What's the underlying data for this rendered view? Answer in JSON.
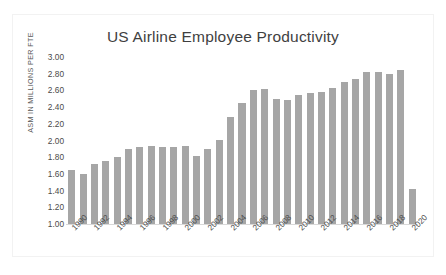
{
  "chart_data": {
    "type": "bar",
    "title": "US Airline Employee Productivity",
    "xlabel": "",
    "ylabel": "ASM IN MILLIONS PER FTE",
    "ylim": [
      1.0,
      3.0
    ],
    "ytick_step": 0.2,
    "ytick_labels": [
      "3.00",
      "2.80",
      "2.60",
      "2.40",
      "2.20",
      "2.00",
      "1.80",
      "1.60",
      "1.40",
      "1.20",
      "1.00"
    ],
    "ytick_values": [
      3.0,
      2.8,
      2.6,
      2.4,
      2.2,
      2.0,
      1.8,
      1.6,
      1.4,
      1.2,
      1.0
    ],
    "grid": false,
    "legend": "none",
    "bar_color": "#a6a6a6",
    "xtick_labels": [
      "1990",
      "1992",
      "1994",
      "1996",
      "1998",
      "2000",
      "2002",
      "2004",
      "2006",
      "2008",
      "2010",
      "2012",
      "2014",
      "2016",
      "2018",
      "2020"
    ],
    "categories": [
      "1990",
      "1991",
      "1992",
      "1993",
      "1994",
      "1995",
      "1996",
      "1997",
      "1998",
      "1999",
      "2000",
      "2001",
      "2002",
      "2003",
      "2004",
      "2005",
      "2006",
      "2007",
      "2008",
      "2009",
      "2010",
      "2011",
      "2012",
      "2013",
      "2014",
      "2015",
      "2016",
      "2017",
      "2018",
      "2019",
      "2020"
    ],
    "values": [
      1.65,
      1.6,
      1.72,
      1.75,
      1.8,
      1.9,
      1.92,
      1.93,
      1.92,
      1.92,
      1.93,
      1.81,
      1.9,
      2.01,
      2.28,
      2.45,
      2.6,
      2.62,
      2.5,
      2.48,
      2.54,
      2.57,
      2.58,
      2.63,
      2.7,
      2.74,
      2.82,
      2.82,
      2.8,
      2.84,
      1.42
    ]
  }
}
